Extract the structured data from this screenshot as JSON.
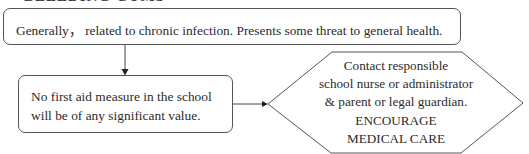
{
  "heading": "BLEEDING GUMS",
  "flowchart": {
    "top_box": {
      "text": "Generally， related to chronic infection. Presents some threat to general health."
    },
    "middle_box": {
      "lines": [
        "No first aid measure in the school",
        "will be of any significant value."
      ]
    },
    "action_hexagon": {
      "lines": [
        "Contact responsible",
        "school nurse or administrator",
        "& parent or legal guardian.",
        "ENCOURAGE",
        "MEDICAL CARE"
      ]
    },
    "connectors": [
      {
        "from": "top_box",
        "to": "middle_box",
        "direction": "down"
      },
      {
        "from": "middle_box",
        "to": "action_hexagon",
        "direction": "right"
      }
    ]
  }
}
